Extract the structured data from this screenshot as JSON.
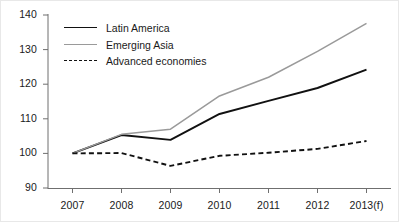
{
  "chart_data": {
    "type": "line",
    "title": "",
    "xlabel": "",
    "ylabel": "",
    "categories": [
      "2007",
      "2008",
      "2009",
      "2010",
      "2011",
      "2012",
      "2013(f)"
    ],
    "ylim": [
      90,
      140
    ],
    "yticks": [
      90,
      100,
      110,
      120,
      130,
      140
    ],
    "grid": false,
    "legend_position": "top-left",
    "series": [
      {
        "name": "Latin America",
        "style": "solid",
        "color": "#111111",
        "values": [
          100,
          105.3,
          103.9,
          111.4,
          115.2,
          118.9,
          124.2
        ]
      },
      {
        "name": "Emerging Asia",
        "style": "solid",
        "color": "#9a9a9a",
        "values": [
          100,
          105.5,
          107.0,
          116.6,
          122.0,
          129.5,
          137.6
        ]
      },
      {
        "name": "Advanced economies",
        "style": "dashed",
        "color": "#111111",
        "values": [
          100,
          100.1,
          96.4,
          99.3,
          100.2,
          101.3,
          103.6
        ]
      }
    ]
  },
  "axes": {
    "y_tick_labels": [
      "140",
      "130",
      "120",
      "110",
      "100",
      "90"
    ],
    "x_tick_labels": [
      "2007",
      "2008",
      "2009",
      "2010",
      "2011",
      "2012",
      "2013(f)"
    ]
  },
  "legend": {
    "items": [
      {
        "label": "Latin America",
        "swatch": "solid-black-line-icon"
      },
      {
        "label": "Emerging Asia",
        "swatch": "solid-gray-line-icon"
      },
      {
        "label": "Advanced economies",
        "swatch": "dashed-black-line-icon"
      }
    ]
  }
}
